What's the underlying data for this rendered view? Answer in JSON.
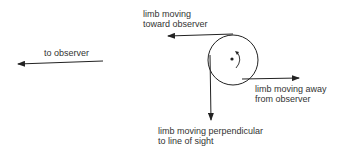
{
  "diagram": {
    "labels": {
      "to_observer": "to observer",
      "toward": [
        "limb moving",
        "toward observer"
      ],
      "away": [
        "limb moving away",
        "from observer"
      ],
      "perpendicular": [
        "limb moving perpendicular",
        "to line of sight"
      ]
    },
    "colors": {
      "stroke": "#222222",
      "text": "#333333"
    }
  }
}
